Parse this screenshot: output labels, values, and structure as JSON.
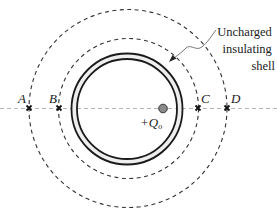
{
  "diagram": {
    "shell_label_lines": [
      "Uncharged",
      "insulating",
      "shell"
    ],
    "charge_label": "+Q",
    "charge_subscript": "o",
    "points": [
      {
        "id": "A",
        "label": "A"
      },
      {
        "id": "B",
        "label": "B"
      },
      {
        "id": "C",
        "label": "C"
      },
      {
        "id": "D",
        "label": "D"
      }
    ],
    "colors": {
      "line": "#1a1a1a",
      "dashed": "#333333",
      "axis": "#b5b5b5",
      "shell_fill": "#eeeeee",
      "charge_fill": "#8a8a8a"
    }
  }
}
